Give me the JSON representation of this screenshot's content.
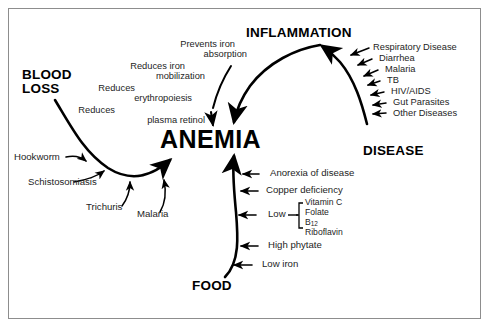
{
  "figure": {
    "center_node": "ANEMIA",
    "caption_fragment": ""
  },
  "nodes": {
    "blood_loss_line1": "BLOOD",
    "blood_loss_line2": "LOSS",
    "inflammation": "INFLAMMATION",
    "disease": "DISEASE",
    "food": "FOOD"
  },
  "inflammation_effects": [
    {
      "line1": "Prevents iron",
      "line2": "absorption"
    },
    {
      "line1": "Reduces iron",
      "line2": "mobilization"
    },
    {
      "line1": "Reduces",
      "line2": "erythropoiesis"
    },
    {
      "line1": "Reduces",
      "line2": "plasma retinol"
    }
  ],
  "disease_causes": [
    "Respiratory Disease",
    "Diarrhea",
    "Malaria",
    "TB",
    "HIV/AIDS",
    "Gut Parasites",
    "Other Diseases"
  ],
  "blood_loss_causes": [
    "Hookworm",
    "Schistosomiasis",
    "Trichuris",
    "Malaria"
  ],
  "food_factors": [
    "Anorexia of disease",
    "Copper deficiency",
    "Low",
    "High phytate",
    "Low iron"
  ],
  "low_nutrients": {
    "items": [
      "Vitamin C",
      "Folate",
      "B",
      "Riboflavin"
    ],
    "b12_subscript": "12"
  },
  "colors": {
    "ink": "#000000",
    "text": "#242424",
    "frame": "#8d8d8d",
    "background": "#ffffff"
  }
}
